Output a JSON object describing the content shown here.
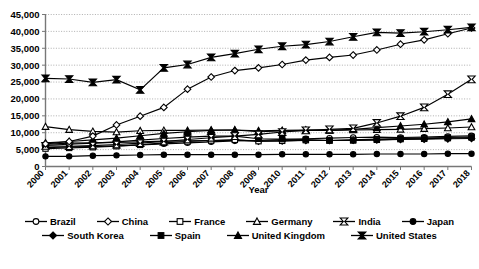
{
  "chart_data": {
    "type": "line",
    "title": "",
    "xlabel": "Year",
    "ylabel": "",
    "grid": true,
    "legend_position": "bottom",
    "ylim": [
      0,
      45000
    ],
    "ytick_step": 5000,
    "ytick_labels": [
      "0",
      "5,000",
      "10,000",
      "15,000",
      "20,000",
      "25,000",
      "30,000",
      "35,000",
      "40,000",
      "45,000"
    ],
    "yticks": [
      0,
      5000,
      10000,
      15000,
      20000,
      25000,
      30000,
      35000,
      40000,
      45000
    ],
    "categories": [
      "2000",
      "2001",
      "2002",
      "2003",
      "2004",
      "2005",
      "2006",
      "2007",
      "2008",
      "2009",
      "2010",
      "2011",
      "2012",
      "2013",
      "2014",
      "2015",
      "2016",
      "2017",
      "2018"
    ],
    "x": [
      2000,
      2001,
      2002,
      2003,
      2004,
      2005,
      2006,
      2007,
      2008,
      2009,
      2010,
      2011,
      2012,
      2013,
      2014,
      2015,
      2016,
      2017,
      2018
    ],
    "series": [
      {
        "name": "Brazil",
        "marker": "open-circle",
        "values": [
          5600,
          5800,
          5900,
          6100,
          6400,
          6700,
          7000,
          7300,
          7600,
          7700,
          8000,
          8200,
          8400,
          8600,
          8700,
          8600,
          8700,
          8900,
          9100
        ]
      },
      {
        "name": "China",
        "marker": "open-diamond",
        "values": [
          6700,
          7400,
          9000,
          12300,
          14900,
          17500,
          22900,
          26500,
          28400,
          29200,
          30200,
          31500,
          32300,
          33000,
          34500,
          36200,
          37500,
          39300,
          41000
        ]
      },
      {
        "name": "France",
        "marker": "open-square",
        "values": [
          5300,
          5500,
          5700,
          6000,
          6400,
          7000,
          7400,
          7700,
          7900,
          7500,
          7600,
          7800,
          7700,
          7900,
          8100,
          8300,
          8400,
          8600,
          8800
        ]
      },
      {
        "name": "Germany",
        "marker": "open-triangle",
        "values": [
          11800,
          10900,
          10400,
          10200,
          10600,
          10700,
          10700,
          10800,
          10800,
          10600,
          10700,
          10800,
          10700,
          10800,
          10900,
          11000,
          11200,
          11400,
          11700
        ]
      },
      {
        "name": "India",
        "marker": "open-bowtie",
        "values": [
          6100,
          6000,
          6200,
          6500,
          6900,
          7400,
          8000,
          8500,
          9000,
          9500,
          10200,
          10700,
          11000,
          11300,
          12900,
          14900,
          17500,
          21400,
          25800
        ]
      },
      {
        "name": "Japan",
        "marker": "filled-circle",
        "values": [
          3000,
          3000,
          3200,
          3300,
          3400,
          3500,
          3500,
          3500,
          3500,
          3500,
          3600,
          3600,
          3600,
          3600,
          3700,
          3700,
          3700,
          3800,
          3800
        ]
      },
      {
        "name": "South Korea",
        "marker": "filled-diamond",
        "values": [
          6600,
          6900,
          7000,
          7100,
          7300,
          7500,
          7600,
          7700,
          7800,
          7500,
          7600,
          7700,
          7700,
          7800,
          7900,
          8000,
          8100,
          8200,
          8300
        ]
      },
      {
        "name": "Spain",
        "marker": "filled-square",
        "values": [
          6300,
          6600,
          6900,
          7300,
          7800,
          8300,
          8700,
          9000,
          9000,
          8200,
          8100,
          8000,
          7700,
          7700,
          7900,
          8100,
          8200,
          8400,
          8600
        ]
      },
      {
        "name": "United Kingdom",
        "marker": "filled-triangle",
        "values": [
          7000,
          7400,
          7900,
          8400,
          9100,
          9800,
          10300,
          10700,
          10800,
          10300,
          10500,
          10700,
          10700,
          11000,
          11500,
          12000,
          12500,
          13200,
          14100
        ]
      },
      {
        "name": "United States",
        "marker": "filled-bowtie",
        "values": [
          26100,
          25900,
          24900,
          25700,
          22700,
          29200,
          30200,
          32300,
          33400,
          34700,
          35600,
          36100,
          37000,
          38400,
          39700,
          39500,
          39900,
          40500,
          41200
        ]
      }
    ]
  },
  "legend": {
    "items": [
      {
        "label": "Brazil",
        "marker": "open-circle"
      },
      {
        "label": "China",
        "marker": "open-diamond"
      },
      {
        "label": "France",
        "marker": "open-square"
      },
      {
        "label": "Germany",
        "marker": "open-triangle"
      },
      {
        "label": "India",
        "marker": "open-bowtie"
      },
      {
        "label": "Japan",
        "marker": "filled-circle"
      },
      {
        "label": "South Korea",
        "marker": "filled-diamond"
      },
      {
        "label": "Spain",
        "marker": "filled-square"
      },
      {
        "label": "United Kingdom",
        "marker": "filled-triangle"
      },
      {
        "label": "United States",
        "marker": "filled-bowtie"
      }
    ]
  },
  "axis": {
    "x_title": "Year"
  },
  "caption": {
    "text": ""
  },
  "colors": {
    "line": "#000000",
    "grid": "#9a9a9a",
    "axis": "#777777",
    "background": "#ffffff"
  }
}
